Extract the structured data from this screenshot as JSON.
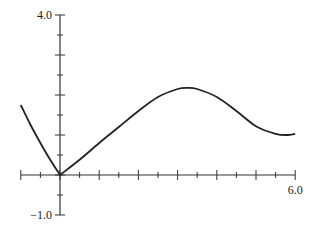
{
  "chart_data": {
    "type": "line",
    "title": "",
    "xlabel": "",
    "ylabel": "",
    "xlim": [
      -1.0,
      6.0
    ],
    "ylim": [
      -1.0,
      4.0
    ],
    "x_tick_step": 0.5,
    "y_tick_step": 0.5,
    "x_tick_labels": [
      {
        "value": 6.0,
        "label": "6.0"
      }
    ],
    "y_tick_labels": [
      {
        "value": 4.0,
        "label": "4.0"
      },
      {
        "value": -1.0,
        "label": "-1.0"
      }
    ],
    "grid": false,
    "legend": null,
    "series": [
      {
        "name": "f(x)",
        "color": "#222222",
        "x": [
          -1.0,
          -0.75,
          -0.5,
          -0.25,
          0.0,
          0.5,
          1.0,
          1.5,
          2.0,
          2.5,
          3.0,
          3.25,
          3.5,
          4.0,
          4.5,
          5.0,
          5.5,
          5.8,
          6.0
        ],
        "y": [
          1.75,
          1.25,
          0.8,
          0.38,
          0.0,
          0.38,
          0.8,
          1.2,
          1.6,
          1.95,
          2.15,
          2.18,
          2.15,
          1.95,
          1.6,
          1.22,
          1.03,
          1.0,
          1.03
        ]
      }
    ]
  }
}
